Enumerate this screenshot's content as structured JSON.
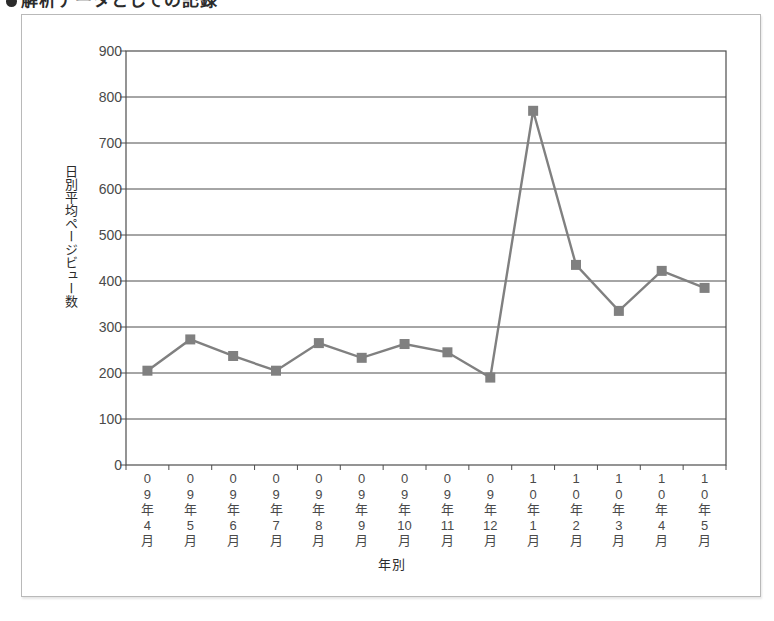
{
  "heading": {
    "bullet": "●",
    "text": "解析データとしての記録"
  },
  "chart_data": {
    "type": "line",
    "title": "",
    "xlabel": "年別",
    "ylabel": "日別平均ページビュー数",
    "categories": [
      "09年4月",
      "09年5月",
      "09年6月",
      "09年7月",
      "09年8月",
      "09年9月",
      "09年10月",
      "09年11月",
      "09年12月",
      "10年1月",
      "10年2月",
      "10年3月",
      "10年4月",
      "10年5月"
    ],
    "category_lines": [
      [
        "0",
        "9",
        "年",
        "4",
        "月"
      ],
      [
        "0",
        "9",
        "年",
        "5",
        "月"
      ],
      [
        "0",
        "9",
        "年",
        "6",
        "月"
      ],
      [
        "0",
        "9",
        "年",
        "7",
        "月"
      ],
      [
        "0",
        "9",
        "年",
        "8",
        "月"
      ],
      [
        "0",
        "9",
        "年",
        "9",
        "月"
      ],
      [
        "0",
        "9",
        "年",
        "10",
        "月"
      ],
      [
        "0",
        "9",
        "年",
        "11",
        "月"
      ],
      [
        "0",
        "9",
        "年",
        "12",
        "月"
      ],
      [
        "1",
        "0",
        "年",
        "1",
        "月"
      ],
      [
        "1",
        "0",
        "年",
        "2",
        "月"
      ],
      [
        "1",
        "0",
        "年",
        "3",
        "月"
      ],
      [
        "1",
        "0",
        "年",
        "4",
        "月"
      ],
      [
        "1",
        "0",
        "年",
        "5",
        "月"
      ]
    ],
    "values": [
      205,
      273,
      237,
      205,
      265,
      233,
      263,
      245,
      190,
      770,
      435,
      335,
      422,
      385
    ],
    "ylim": [
      0,
      900
    ],
    "yticks": [
      900,
      800,
      700,
      600,
      500,
      400,
      300,
      200,
      100,
      0
    ],
    "grid": true,
    "legend": "none",
    "series_color": "#808080",
    "marker": "square",
    "axis_color": "#4d4d4d"
  }
}
